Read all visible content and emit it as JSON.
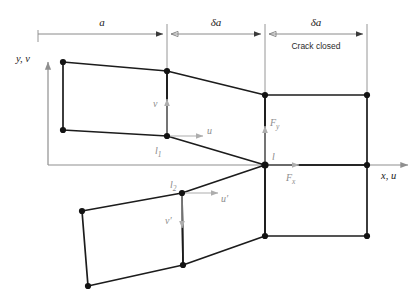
{
  "figure": {
    "dimensions": {
      "segment_1_label": "a",
      "segment_2_label": "δa",
      "segment_3_label": "δa",
      "segment_3_note": "Crack closed"
    },
    "axes": {
      "vertical_label_main": "y",
      "vertical_label_sep": ",",
      "vertical_label_second": "v",
      "vertical_label_full": "y, v",
      "horizontal_label_full": "x, u"
    },
    "nodes": [
      {
        "id": "l1",
        "label": "l",
        "sub": "1"
      },
      {
        "id": "l2",
        "label": "l",
        "sub": "2"
      },
      {
        "id": "l",
        "label": "l",
        "sub": ""
      }
    ],
    "displacements": [
      {
        "id": "v-upper",
        "label": "v",
        "direction": "up"
      },
      {
        "id": "u-upper",
        "label": "u",
        "direction": "right"
      },
      {
        "id": "u-lower",
        "label": "u′",
        "direction": "right"
      },
      {
        "id": "v-lower",
        "label": "v′",
        "direction": "down"
      }
    ],
    "forces": [
      {
        "id": "Fy",
        "label": "F",
        "sub": "y",
        "direction": "up"
      },
      {
        "id": "Fx",
        "label": "F",
        "sub": "x",
        "direction": "right"
      }
    ],
    "colors": {
      "mesh": "#1c1c1c",
      "node": "#131313",
      "axis": "#8f8f8f",
      "dimension": "#8a8a8a",
      "annotation_gray": "#8d8d8d",
      "background": "#ffffff"
    }
  }
}
